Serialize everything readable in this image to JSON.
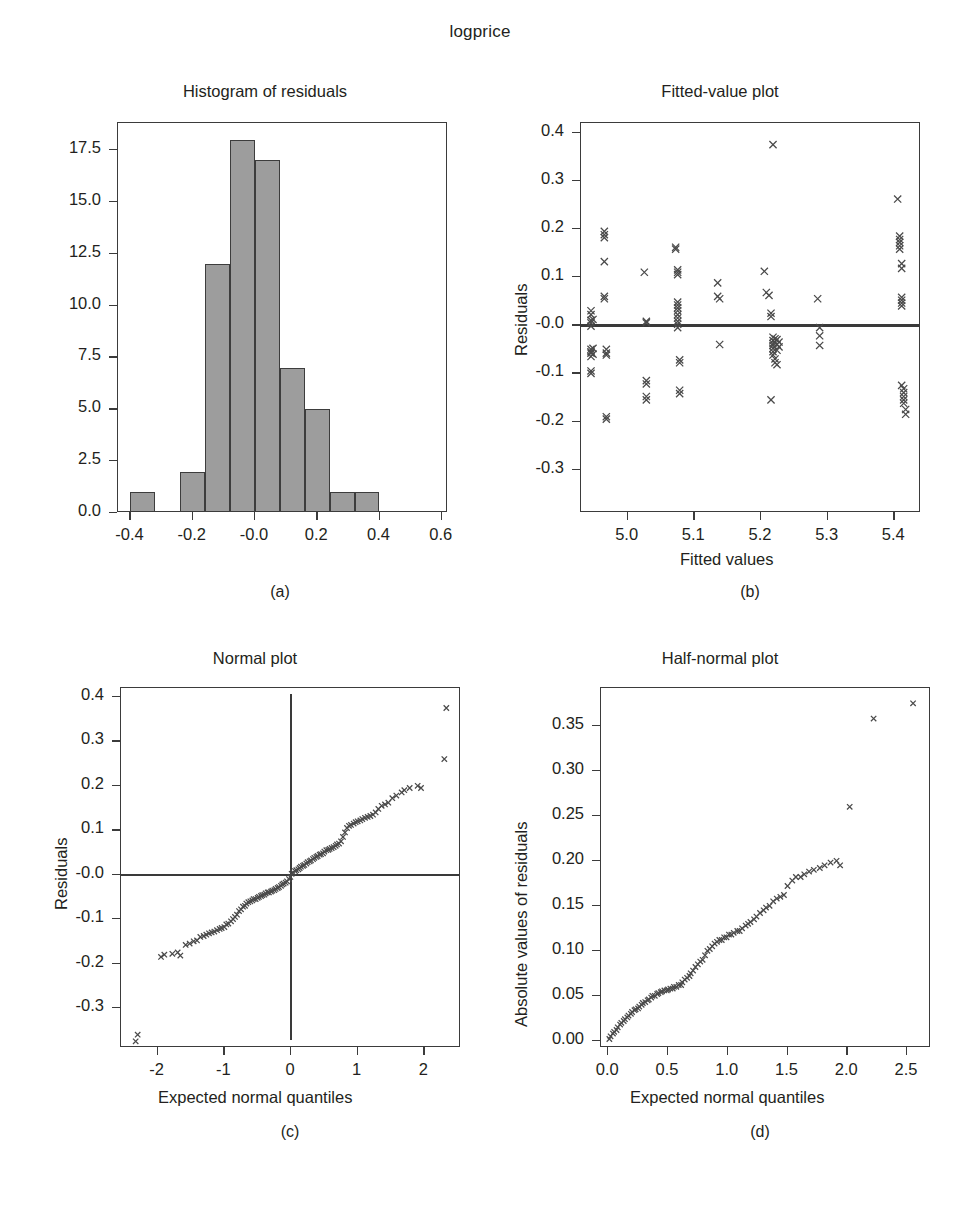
{
  "figure": {
    "title": "logprice",
    "panel_captions": [
      "(a)",
      "(b)",
      "(c)",
      "(d)"
    ]
  },
  "chart_data": [
    {
      "type": "bar",
      "panel": "a",
      "caption": "(a)",
      "title": "Histogram of residuals",
      "xlabel": "",
      "ylabel": "",
      "xlim": [
        -0.44,
        0.62
      ],
      "ylim": [
        0,
        18.8
      ],
      "grid": false,
      "legend": "none",
      "xticks": [
        "-0.4",
        "-0.2",
        "-0.0",
        "0.2",
        "0.4",
        "0.6"
      ],
      "xtick_values": [
        -0.4,
        -0.2,
        0.0,
        0.2,
        0.4,
        0.6
      ],
      "yticks": [
        "0.0",
        "2.5",
        "5.0",
        "7.5",
        "10.0",
        "12.5",
        "15.0",
        "17.5"
      ],
      "ytick_values": [
        0.0,
        2.5,
        5.0,
        7.5,
        10.0,
        12.5,
        15.0,
        17.5
      ],
      "bin_edges": [
        -0.4,
        -0.32,
        -0.24,
        -0.16,
        -0.08,
        0.0,
        0.08,
        0.16,
        0.24,
        0.32,
        0.4
      ],
      "categories": [
        "-0.40",
        "-0.32",
        "-0.24",
        "-0.16",
        "-0.08",
        "0.00",
        "0.08",
        "0.16",
        "0.24",
        "0.32"
      ],
      "values": [
        1,
        0,
        2,
        12,
        18,
        17,
        7,
        5,
        1,
        1
      ]
    },
    {
      "type": "scatter",
      "panel": "b",
      "caption": "(b)",
      "title": "Fitted-value plot",
      "xlabel": "Fitted values",
      "ylabel": "Residuals",
      "xlim": [
        4.93,
        5.44
      ],
      "ylim": [
        -0.39,
        0.42
      ],
      "grid": false,
      "legend": "none",
      "xticks": [
        "5.0",
        "5.1",
        "5.2",
        "5.3",
        "5.4"
      ],
      "xtick_values": [
        5.0,
        5.1,
        5.2,
        5.3,
        5.4
      ],
      "yticks": [
        "-0.3",
        "-0.2",
        "-0.1",
        "-0.0",
        "0.1",
        "0.2",
        "0.3",
        "0.4"
      ],
      "ytick_values": [
        -0.3,
        -0.2,
        -0.1,
        0.0,
        0.1,
        0.2,
        0.3,
        0.4
      ],
      "reference_line": {
        "orientation": "horizontal",
        "y": 0.0
      },
      "x": [
        4.945,
        4.945,
        4.945,
        4.945,
        4.945,
        4.945,
        4.945,
        4.945,
        4.945,
        4.945,
        4.945,
        4.948,
        4.948,
        4.948,
        4.965,
        4.965,
        4.965,
        4.965,
        4.965,
        4.965,
        4.968,
        4.968,
        4.968,
        4.968,
        4.968,
        5.025,
        5.028,
        5.028,
        5.028,
        5.028,
        5.028,
        5.028,
        5.072,
        5.072,
        5.075,
        5.075,
        5.075,
        5.075,
        5.075,
        5.075,
        5.075,
        5.075,
        5.075,
        5.075,
        5.075,
        5.075,
        5.078,
        5.078,
        5.078,
        5.078,
        5.135,
        5.135,
        5.138,
        5.138,
        5.205,
        5.208,
        5.212,
        5.215,
        5.215,
        5.218,
        5.218,
        5.218,
        5.218,
        5.218,
        5.218,
        5.218,
        5.218,
        5.221,
        5.221,
        5.221,
        5.221,
        5.224,
        5.224,
        5.224,
        5.224,
        5.227,
        5.227,
        5.215,
        5.285,
        5.288,
        5.288,
        5.288,
        5.405,
        5.408,
        5.408,
        5.408,
        5.408,
        5.408,
        5.411,
        5.411,
        5.411,
        5.411,
        5.411,
        5.411,
        5.411,
        5.414,
        5.414,
        5.414,
        5.414,
        5.414,
        5.417,
        5.417
      ],
      "y": [
        0.03,
        0.022,
        0.01,
        0.005,
        -0.002,
        -0.05,
        -0.058,
        -0.065,
        -0.095,
        -0.1,
        -0.055,
        0.012,
        -0.048,
        -0.06,
        0.195,
        0.188,
        0.182,
        0.132,
        0.06,
        0.055,
        -0.05,
        -0.058,
        -0.062,
        -0.19,
        -0.195,
        0.11,
        0.008,
        0.005,
        -0.115,
        -0.122,
        -0.148,
        -0.155,
        0.162,
        0.158,
        0.115,
        0.11,
        0.105,
        0.048,
        0.042,
        0.036,
        0.03,
        0.022,
        0.015,
        0.008,
        0.002,
        -0.005,
        -0.072,
        -0.078,
        -0.135,
        -0.142,
        0.088,
        0.06,
        0.055,
        -0.04,
        0.112,
        0.068,
        0.062,
        0.025,
        0.018,
        0.375,
        -0.025,
        -0.032,
        -0.038,
        -0.042,
        -0.048,
        -0.055,
        -0.062,
        -0.028,
        -0.035,
        -0.07,
        -0.078,
        -0.03,
        -0.04,
        -0.052,
        -0.082,
        -0.035,
        -0.045,
        -0.155,
        0.055,
        -0.005,
        -0.022,
        -0.042,
        0.262,
        0.185,
        0.178,
        0.172,
        0.165,
        0.158,
        0.128,
        0.118,
        0.058,
        0.052,
        0.046,
        0.04,
        -0.125,
        -0.132,
        -0.14,
        -0.148,
        -0.155,
        -0.162,
        -0.175,
        -0.185
      ]
    },
    {
      "type": "scatter",
      "panel": "c",
      "caption": "(c)",
      "title": "Normal plot",
      "xlabel": "Expected normal quantiles",
      "ylabel": "Residuals",
      "xlim": [
        -2.55,
        2.55
      ],
      "ylim": [
        -0.39,
        0.42
      ],
      "grid": false,
      "legend": "none",
      "xticks": [
        "-2",
        "-1",
        "0",
        "1",
        "2"
      ],
      "xtick_values": [
        -2,
        -1,
        0,
        1,
        2
      ],
      "yticks": [
        "-0.3",
        "-0.2",
        "-0.1",
        "-0.0",
        "0.1",
        "0.2",
        "0.3",
        "0.4"
      ],
      "ytick_values": [
        -0.3,
        -0.2,
        -0.1,
        0.0,
        0.1,
        0.2,
        0.3,
        0.4
      ],
      "reference_lines": [
        {
          "orientation": "horizontal",
          "y": 0.0
        },
        {
          "orientation": "vertical",
          "x": 0.0
        }
      ],
      "x": [
        -2.33,
        -2.3,
        -1.95,
        -1.9,
        -1.78,
        -1.7,
        -1.66,
        -1.58,
        -1.52,
        -1.46,
        -1.41,
        -1.36,
        -1.31,
        -1.27,
        -1.23,
        -1.19,
        -1.15,
        -1.11,
        -1.07,
        -1.04,
        -1.0,
        -0.97,
        -0.94,
        -0.9,
        -0.87,
        -0.84,
        -0.81,
        -0.78,
        -0.75,
        -0.72,
        -0.69,
        -0.67,
        -0.64,
        -0.61,
        -0.58,
        -0.56,
        -0.53,
        -0.5,
        -0.48,
        -0.45,
        -0.43,
        -0.4,
        -0.38,
        -0.35,
        -0.33,
        -0.3,
        -0.28,
        -0.25,
        -0.23,
        -0.2,
        -0.18,
        -0.15,
        -0.13,
        -0.11,
        -0.08,
        -0.06,
        -0.03,
        -0.01,
        0.01,
        0.03,
        0.06,
        0.08,
        0.11,
        0.13,
        0.15,
        0.18,
        0.2,
        0.23,
        0.25,
        0.28,
        0.3,
        0.33,
        0.35,
        0.38,
        0.4,
        0.43,
        0.45,
        0.48,
        0.5,
        0.53,
        0.56,
        0.58,
        0.61,
        0.64,
        0.67,
        0.69,
        0.72,
        0.75,
        0.78,
        0.81,
        0.84,
        0.87,
        0.9,
        0.94,
        0.97,
        1.0,
        1.04,
        1.07,
        1.11,
        1.15,
        1.19,
        1.23,
        1.27,
        1.31,
        1.36,
        1.41,
        1.46,
        1.52,
        1.58,
        1.66,
        1.7,
        1.78,
        1.9,
        1.95,
        2.3,
        2.33
      ],
      "y": [
        -0.375,
        -0.36,
        -0.185,
        -0.18,
        -0.178,
        -0.175,
        -0.182,
        -0.158,
        -0.155,
        -0.15,
        -0.148,
        -0.14,
        -0.138,
        -0.135,
        -0.132,
        -0.13,
        -0.128,
        -0.125,
        -0.122,
        -0.12,
        -0.118,
        -0.112,
        -0.11,
        -0.105,
        -0.1,
        -0.095,
        -0.09,
        -0.082,
        -0.078,
        -0.072,
        -0.07,
        -0.065,
        -0.062,
        -0.06,
        -0.058,
        -0.055,
        -0.055,
        -0.052,
        -0.05,
        -0.048,
        -0.046,
        -0.045,
        -0.042,
        -0.04,
        -0.04,
        -0.038,
        -0.036,
        -0.035,
        -0.032,
        -0.03,
        -0.028,
        -0.025,
        -0.022,
        -0.02,
        -0.018,
        -0.015,
        -0.01,
        -0.005,
        0.002,
        0.005,
        0.008,
        0.01,
        0.012,
        0.015,
        0.018,
        0.02,
        0.022,
        0.025,
        0.028,
        0.03,
        0.032,
        0.035,
        0.038,
        0.04,
        0.042,
        0.045,
        0.046,
        0.048,
        0.052,
        0.055,
        0.056,
        0.058,
        0.06,
        0.062,
        0.065,
        0.068,
        0.07,
        0.075,
        0.085,
        0.095,
        0.105,
        0.11,
        0.112,
        0.115,
        0.118,
        0.12,
        0.122,
        0.125,
        0.128,
        0.13,
        0.132,
        0.135,
        0.14,
        0.148,
        0.155,
        0.158,
        0.162,
        0.172,
        0.178,
        0.185,
        0.19,
        0.195,
        0.2,
        0.195,
        0.26,
        0.375
      ]
    },
    {
      "type": "scatter",
      "panel": "d",
      "caption": "(d)",
      "title": "Half-normal plot",
      "xlabel": "Expected normal quantiles",
      "ylabel": "Absolute values of residuals",
      "xlim": [
        -0.06,
        2.7
      ],
      "ylim": [
        -0.008,
        0.392
      ],
      "grid": false,
      "legend": "none",
      "xticks": [
        "0.0",
        "0.5",
        "1.0",
        "1.5",
        "2.0",
        "2.5"
      ],
      "xtick_values": [
        0.0,
        0.5,
        1.0,
        1.5,
        2.0,
        2.5
      ],
      "yticks": [
        "0.00",
        "0.05",
        "0.10",
        "0.15",
        "0.20",
        "0.25",
        "0.30",
        "0.35"
      ],
      "ytick_values": [
        0.0,
        0.05,
        0.1,
        0.15,
        0.2,
        0.25,
        0.3,
        0.35
      ],
      "x": [
        0.01,
        0.02,
        0.04,
        0.05,
        0.07,
        0.08,
        0.1,
        0.11,
        0.13,
        0.14,
        0.16,
        0.17,
        0.19,
        0.2,
        0.22,
        0.23,
        0.25,
        0.26,
        0.28,
        0.29,
        0.31,
        0.33,
        0.34,
        0.36,
        0.37,
        0.39,
        0.41,
        0.42,
        0.44,
        0.45,
        0.47,
        0.49,
        0.5,
        0.52,
        0.54,
        0.55,
        0.57,
        0.59,
        0.61,
        0.62,
        0.64,
        0.66,
        0.68,
        0.69,
        0.71,
        0.73,
        0.75,
        0.77,
        0.79,
        0.81,
        0.83,
        0.85,
        0.87,
        0.89,
        0.91,
        0.93,
        0.95,
        0.97,
        0.99,
        1.01,
        1.03,
        1.05,
        1.08,
        1.1,
        1.12,
        1.15,
        1.17,
        1.19,
        1.22,
        1.24,
        1.27,
        1.3,
        1.32,
        1.35,
        1.38,
        1.41,
        1.44,
        1.47,
        1.5,
        1.54,
        1.57,
        1.61,
        1.64,
        1.68,
        1.72,
        1.77,
        1.81,
        1.86,
        1.91,
        1.94,
        2.02,
        2.22,
        2.55
      ],
      "y": [
        0.002,
        0.005,
        0.008,
        0.01,
        0.012,
        0.015,
        0.018,
        0.02,
        0.022,
        0.024,
        0.026,
        0.028,
        0.03,
        0.032,
        0.034,
        0.035,
        0.036,
        0.038,
        0.04,
        0.042,
        0.043,
        0.045,
        0.046,
        0.048,
        0.05,
        0.05,
        0.052,
        0.053,
        0.054,
        0.055,
        0.056,
        0.056,
        0.057,
        0.058,
        0.058,
        0.06,
        0.06,
        0.062,
        0.062,
        0.065,
        0.068,
        0.07,
        0.072,
        0.075,
        0.078,
        0.082,
        0.085,
        0.088,
        0.09,
        0.095,
        0.1,
        0.102,
        0.105,
        0.108,
        0.11,
        0.112,
        0.112,
        0.115,
        0.115,
        0.118,
        0.118,
        0.12,
        0.122,
        0.122,
        0.125,
        0.128,
        0.13,
        0.132,
        0.135,
        0.138,
        0.142,
        0.145,
        0.148,
        0.15,
        0.155,
        0.158,
        0.16,
        0.162,
        0.172,
        0.178,
        0.182,
        0.182,
        0.185,
        0.188,
        0.19,
        0.192,
        0.195,
        0.198,
        0.2,
        0.195,
        0.26,
        0.358,
        0.375
      ]
    }
  ]
}
